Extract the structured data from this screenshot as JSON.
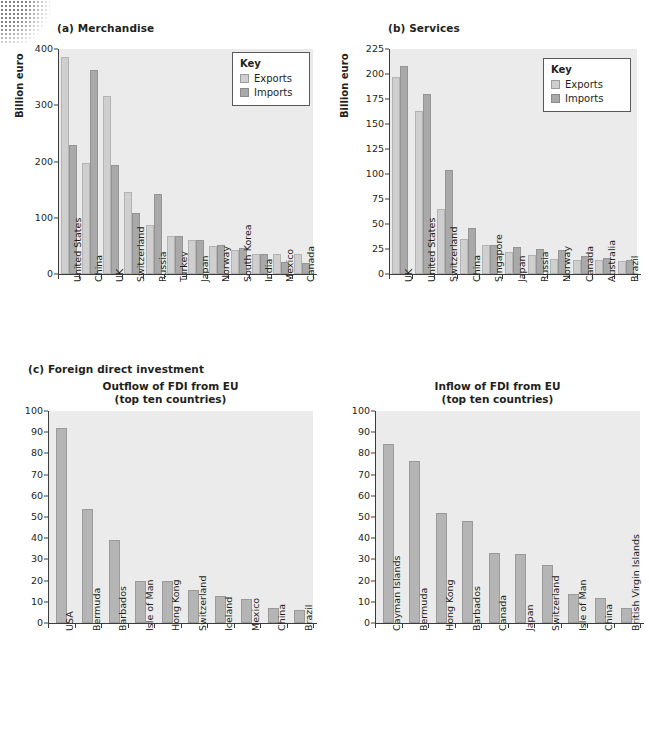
{
  "figure": {
    "panel_a_title": "(a) Merchandise",
    "panel_b_title": "(b) Services",
    "panel_c_title": "(c) Foreign direct investment",
    "axis_label": "Billion euro",
    "key_title": "Key",
    "key_exports": "Exports",
    "key_imports": "Imports",
    "fdi_out_title_line1": "Outflow of FDI from EU",
    "fdi_out_title_line2": "(top ten countries)",
    "fdi_in_title_line1": "Inflow of FDI from EU",
    "fdi_in_title_line2": "(top ten countries)"
  },
  "colors": {
    "exports": "#cfcfcf",
    "imports": "#a9a9a9",
    "single": "#b5b5b5",
    "plot_background": "#ebebeb",
    "axis": "#3c3c3c",
    "text": "#231f20"
  },
  "chart_data": [
    {
      "id": "merchandise",
      "type": "bar",
      "title": "(a) Merchandise",
      "xlabel": "",
      "ylabel": "Billion euro",
      "ylim": [
        0,
        400
      ],
      "yticks": [
        0,
        100,
        200,
        300,
        400
      ],
      "grid": false,
      "legend": {
        "position": "top-right",
        "title": "Key",
        "entries": [
          "Exports",
          "Imports"
        ]
      },
      "categories": [
        "United States",
        "China",
        "UK",
        "Switzerland",
        "Russia",
        "Turkey",
        "Japan",
        "Norway",
        "South Korea",
        "India",
        "Mexico",
        "Canada"
      ],
      "series": [
        {
          "name": "Exports",
          "values": [
            385,
            198,
            317,
            146,
            88,
            68,
            61,
            50,
            43,
            36,
            36,
            36
          ]
        },
        {
          "name": "Imports",
          "values": [
            230,
            362,
            193,
            108,
            143,
            68,
            61,
            52,
            46,
            36,
            22,
            20
          ]
        }
      ]
    },
    {
      "id": "services",
      "type": "bar",
      "title": "(b) Services",
      "xlabel": "",
      "ylabel": "Billion euro",
      "ylim": [
        0,
        225
      ],
      "yticks": [
        0,
        25,
        50,
        75,
        100,
        125,
        150,
        175,
        200,
        225
      ],
      "grid": false,
      "legend": {
        "position": "top-right",
        "title": "Key",
        "entries": [
          "Exports",
          "Imports"
        ]
      },
      "categories": [
        "UK",
        "United States",
        "Switzerland",
        "China",
        "Singapore",
        "Japan",
        "Russia",
        "Norway",
        "Canada",
        "Australia",
        "Brazil"
      ],
      "series": [
        {
          "name": "Exports",
          "values": [
            197,
            163,
            65,
            35,
            29,
            22,
            19,
            15,
            14,
            14,
            13
          ]
        },
        {
          "name": "Imports",
          "values": [
            208,
            180,
            104,
            46,
            29,
            27,
            25,
            24,
            18,
            16,
            14
          ]
        }
      ]
    },
    {
      "id": "fdi-outflow",
      "type": "bar",
      "title": "Outflow of FDI from EU (top ten countries)",
      "xlabel": "",
      "ylabel": "",
      "ylim": [
        0,
        100
      ],
      "yticks": [
        0,
        10,
        20,
        30,
        40,
        50,
        60,
        70,
        80,
        90,
        100
      ],
      "grid": false,
      "categories": [
        "USA",
        "Bermuda",
        "Barbados",
        "Isle of Man",
        "Hong Kong",
        "Switzerland",
        "Iceland",
        "Mexico",
        "China",
        "Brazil"
      ],
      "values": [
        92,
        54,
        39,
        20,
        19.7,
        15.5,
        12.7,
        11.5,
        7,
        6
      ]
    },
    {
      "id": "fdi-inflow",
      "type": "bar",
      "title": "Inflow of FDI from EU (top ten countries)",
      "xlabel": "",
      "ylabel": "",
      "ylim": [
        0,
        100
      ],
      "yticks": [
        0,
        10,
        20,
        30,
        40,
        50,
        60,
        70,
        80,
        90,
        100
      ],
      "grid": false,
      "categories": [
        "Cayman Islands",
        "Bermuda",
        "Hong Kong",
        "Barbados",
        "Canada",
        "Japan",
        "Switzerland",
        "Isle of Man",
        "China",
        "British Virgin Islands"
      ],
      "values": [
        84.5,
        76.5,
        52,
        48,
        33,
        32.7,
        27.5,
        13.8,
        11.7,
        7
      ]
    }
  ]
}
